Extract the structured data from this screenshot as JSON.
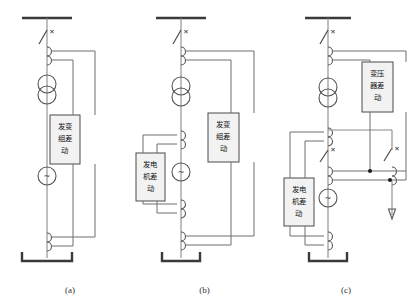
{
  "figure": {
    "type": "electrical-protection-schematic",
    "line_color": "#6e6e6e",
    "box_fill": "#f2f2f2",
    "box_stroke": "#4a4a4a"
  },
  "panels": [
    {
      "id": "a",
      "caption": "(a)",
      "relays": [
        {
          "name": "generator-transformer-unit-differential",
          "lines": [
            "发变",
            "组差",
            "动"
          ],
          "full_text": "发变组差动"
        }
      ],
      "components": [
        {
          "name": "busbar",
          "symbol": "bus"
        },
        {
          "name": "circuit-breaker",
          "symbol": "x-switch"
        },
        {
          "name": "current-transformer-hv",
          "symbol": "ct-coil"
        },
        {
          "name": "power-transformer",
          "symbol": "two-circles"
        },
        {
          "name": "generator",
          "symbol": "circle-tilde",
          "glyph": "~"
        },
        {
          "name": "current-transformer-neutral",
          "symbol": "ct-coil"
        },
        {
          "name": "neutral-ground",
          "symbol": "bracket"
        }
      ]
    },
    {
      "id": "b",
      "caption": "(b)",
      "relays": [
        {
          "name": "generator-differential",
          "lines": [
            "发电",
            "机差",
            "动"
          ],
          "full_text": "发电机差动"
        },
        {
          "name": "generator-transformer-unit-differential",
          "lines": [
            "发变",
            "组差",
            "动"
          ],
          "full_text": "发变组差动"
        }
      ],
      "components": [
        {
          "name": "busbar",
          "symbol": "bus"
        },
        {
          "name": "circuit-breaker",
          "symbol": "x-switch"
        },
        {
          "name": "current-transformer-hv",
          "symbol": "ct-coil"
        },
        {
          "name": "power-transformer",
          "symbol": "two-circles"
        },
        {
          "name": "current-transformer-gen-top",
          "symbol": "ct-coil"
        },
        {
          "name": "generator",
          "symbol": "circle-tilde",
          "glyph": "~"
        },
        {
          "name": "current-transformer-gen-bottom",
          "symbol": "ct-coil"
        },
        {
          "name": "current-transformer-neutral",
          "symbol": "ct-coil"
        },
        {
          "name": "neutral-ground",
          "symbol": "bracket"
        }
      ]
    },
    {
      "id": "c",
      "caption": "(c)",
      "relays": [
        {
          "name": "transformer-differential",
          "lines": [
            "变压",
            "器差",
            "动"
          ],
          "full_text": "变压器差动"
        },
        {
          "name": "generator-differential",
          "lines": [
            "发电",
            "机差",
            "动"
          ],
          "full_text": "发电机差动"
        }
      ],
      "components": [
        {
          "name": "busbar",
          "symbol": "bus"
        },
        {
          "name": "circuit-breaker-hv",
          "symbol": "x-switch"
        },
        {
          "name": "current-transformer-hv",
          "symbol": "ct-coil"
        },
        {
          "name": "power-transformer",
          "symbol": "two-circles"
        },
        {
          "name": "current-transformer-gen-top",
          "symbol": "ct-coil"
        },
        {
          "name": "generator-breaker",
          "symbol": "x-switch"
        },
        {
          "name": "current-transformer-branch-left",
          "symbol": "ct-coil"
        },
        {
          "name": "current-transformer-branch-right",
          "symbol": "ct-coil"
        },
        {
          "name": "branch-breaker",
          "symbol": "x-switch"
        },
        {
          "name": "outgoing-feeder-arrow",
          "symbol": "down-arrow"
        },
        {
          "name": "generator",
          "symbol": "circle-tilde",
          "glyph": "~"
        },
        {
          "name": "current-transformer-neutral",
          "symbol": "ct-coil"
        },
        {
          "name": "neutral-ground",
          "symbol": "bracket"
        },
        {
          "name": "junction-dot-upper",
          "symbol": "dot"
        },
        {
          "name": "junction-dot-lower",
          "symbol": "dot"
        }
      ]
    }
  ]
}
